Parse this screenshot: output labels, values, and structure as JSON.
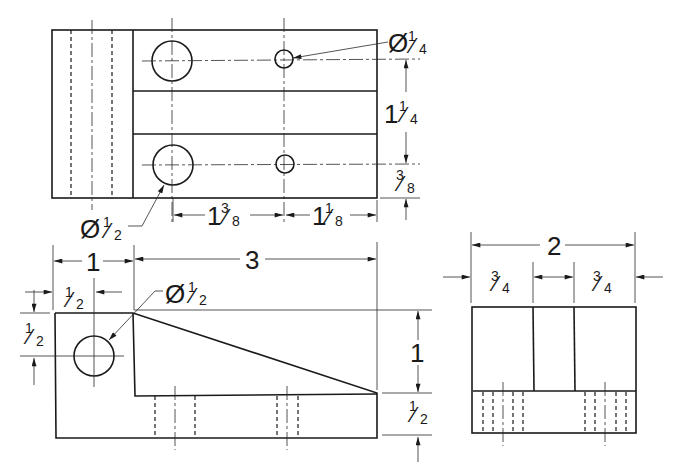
{
  "views": {
    "top": {
      "label": "Top view",
      "dims": {
        "small_hole": {
          "sym": "Ø",
          "whole": "",
          "num": "1",
          "den": "4"
        },
        "large_hole": {
          "sym": "Ø",
          "whole": "",
          "num": "1",
          "den": "2"
        },
        "hole_spacing_vertical": {
          "whole": "1",
          "num": "1",
          "den": "4"
        },
        "hole_edge_offset": {
          "whole": "",
          "num": "3",
          "den": "8"
        },
        "hole_x_from_step": {
          "whole": "1",
          "num": "3",
          "den": "8"
        },
        "hole_x_to_end": {
          "whole": "1",
          "num": "1",
          "den": "8"
        }
      }
    },
    "front": {
      "label": "Front view",
      "dims": {
        "base_width": {
          "whole": "1",
          "num": "",
          "den": ""
        },
        "overall_length": {
          "whole": "3",
          "num": "",
          "den": ""
        },
        "hole_x": {
          "whole": "",
          "num": "1",
          "den": "2"
        },
        "hole_y": {
          "whole": "",
          "num": "1",
          "den": "2"
        },
        "hole_dia": {
          "sym": "Ø",
          "whole": "",
          "num": "1",
          "den": "2"
        },
        "wedge_height": {
          "whole": "1",
          "num": "",
          "den": ""
        },
        "base_height": {
          "whole": "",
          "num": "1",
          "den": "2"
        }
      }
    },
    "side": {
      "label": "Right side view",
      "dims": {
        "overall_width": {
          "whole": "2",
          "num": "",
          "den": ""
        },
        "left_flange": {
          "whole": "",
          "num": "3",
          "den": "4"
        },
        "right_flange": {
          "whole": "",
          "num": "3",
          "den": "4"
        }
      }
    }
  },
  "colors": {
    "line": "#1a1a1a",
    "background": "#ffffff"
  }
}
